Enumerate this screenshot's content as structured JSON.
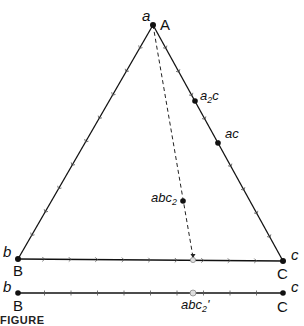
{
  "diagram": {
    "type": "ternary-phase-diagram",
    "vertices": {
      "A": {
        "phase_label": "a",
        "component_label": "A",
        "x": 153,
        "y": 25
      },
      "B": {
        "phase_label": "b",
        "component_label": "B",
        "x": 18,
        "y": 259
      },
      "C": {
        "phase_label": "c",
        "component_label": "C",
        "x": 283,
        "y": 261
      }
    },
    "points": [
      {
        "id": "a2c",
        "label_main": "a",
        "label_sub": "2",
        "label_tail": "c",
        "x": 195,
        "y": 101
      },
      {
        "id": "ac",
        "label_main": "ac",
        "label_sub": "",
        "label_tail": "",
        "x": 218,
        "y": 143
      },
      {
        "id": "abc2",
        "label_main": "abc",
        "label_sub": "2",
        "label_tail": "",
        "x": 183,
        "y": 201
      }
    ],
    "projection": {
      "from": "A",
      "through": "abc2",
      "end": {
        "x": 193,
        "y": 260
      },
      "style": "dashed"
    },
    "binary_line": {
      "left": {
        "phase_label": "b",
        "component_label": "B"
      },
      "right": {
        "phase_label": "c",
        "component_label": "C"
      },
      "y": 293,
      "projected_point": {
        "label_main": "abc",
        "label_sub": "2",
        "label_tail": "'",
        "x": 193
      }
    },
    "ticks_per_side": 10
  },
  "caption": {
    "text": "FIGURE"
  }
}
